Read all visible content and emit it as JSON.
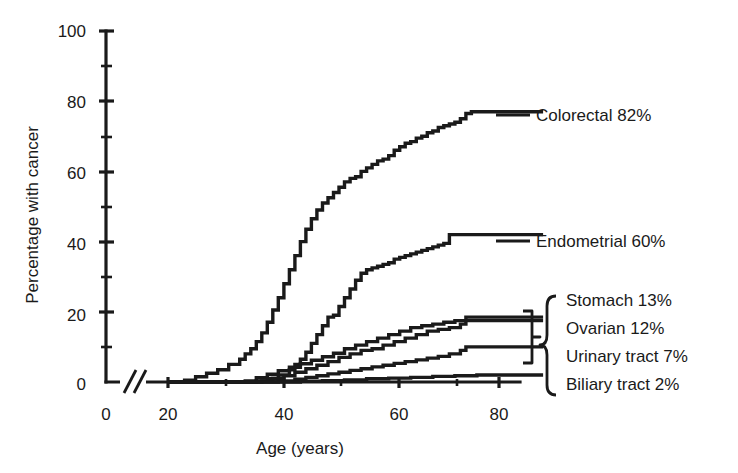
{
  "chart_data": {
    "type": "line",
    "title": "",
    "xlabel": "Age (years)",
    "ylabel": "Percentage with cancer",
    "xlim": [
      0,
      88
    ],
    "ylim": [
      0,
      100
    ],
    "grid": false,
    "axis_break": {
      "present": true,
      "between": [
        2,
        17
      ],
      "axis": "x"
    },
    "legend_position": "right-inline",
    "xticks": [
      0,
      20,
      40,
      60,
      80
    ],
    "xtick_labels": [
      "0",
      "20",
      "40",
      "60",
      "80"
    ],
    "xticks_minor": [
      30,
      50,
      70
    ],
    "yticks": [
      0,
      20,
      40,
      60,
      80,
      100
    ],
    "ytick_labels": [
      "0",
      "20",
      "40",
      "60",
      "80",
      "100"
    ],
    "yticks_minor": [
      10,
      30,
      50,
      70,
      90
    ],
    "series": [
      {
        "name": "Colorectal",
        "label": "Colorectal 82%",
        "final_percent": 82,
        "plateau_value": 77,
        "onset_age": 23,
        "x": [
          20,
          23,
          25,
          27,
          29,
          31,
          33,
          34,
          35,
          36,
          37,
          38,
          39,
          40,
          41,
          42,
          43,
          44,
          45,
          46,
          47,
          48,
          49,
          50,
          51,
          52,
          53,
          54,
          55,
          56,
          57,
          58,
          59,
          60,
          61,
          62,
          63,
          64,
          65,
          66,
          67,
          68,
          69,
          70,
          71,
          72,
          73,
          74,
          75,
          76,
          88
        ],
        "y": [
          0,
          0.5,
          1.5,
          2.5,
          3.5,
          5,
          6.5,
          8,
          9.5,
          11.5,
          14,
          17,
          20.5,
          24,
          28,
          32,
          36,
          40,
          43.5,
          46.5,
          49,
          51,
          52.5,
          54,
          55.5,
          57,
          58,
          58.5,
          60,
          61,
          62,
          63,
          63.5,
          64.5,
          66,
          67,
          68,
          68.5,
          69.5,
          70,
          71,
          71.5,
          72.5,
          73,
          73.5,
          74,
          75,
          76.5,
          77,
          77,
          77
        ]
      },
      {
        "name": "Endometrial",
        "label": "Endometrial 60%",
        "final_percent": 60,
        "plateau_value": 42,
        "onset_age": 38,
        "x": [
          20,
          36,
          38,
          40,
          42,
          43,
          44,
          45,
          46,
          47,
          48,
          49,
          50,
          51,
          52,
          53,
          54,
          55,
          56,
          57,
          58,
          59,
          60,
          61,
          62,
          63,
          64,
          65,
          66,
          67,
          68,
          69,
          70,
          71,
          72,
          73,
          74,
          75,
          88
        ],
        "y": [
          0,
          0.3,
          1,
          2,
          3.5,
          5,
          6.5,
          8.5,
          11,
          13.5,
          16,
          18.5,
          19,
          21.5,
          24,
          26.5,
          29,
          31,
          32,
          32.5,
          33,
          33.5,
          34,
          35,
          35.5,
          36,
          36.5,
          37,
          37.5,
          38,
          38.5,
          39,
          39.5,
          42,
          42,
          42,
          42,
          42,
          42
        ]
      },
      {
        "name": "Stomach",
        "label": "Stomach 13%",
        "final_percent": 13,
        "plateau_value": 18.5,
        "onset_age": 38,
        "x": [
          20,
          37,
          39,
          41,
          43,
          45,
          47,
          49,
          51,
          53,
          55,
          57,
          59,
          61,
          63,
          65,
          67,
          69,
          71,
          73,
          74,
          75,
          88
        ],
        "y": [
          0,
          0.3,
          1,
          1.8,
          2.8,
          3.8,
          4.8,
          5.8,
          7,
          8,
          9,
          9.5,
          10.5,
          11.5,
          12.5,
          13.5,
          14.5,
          15,
          15.5,
          16.5,
          18.5,
          18.5,
          18.5
        ]
      },
      {
        "name": "Ovarian",
        "label": "Ovarian 12%",
        "final_percent": 12,
        "plateau_value": 17.5,
        "onset_age": 36,
        "x": [
          20,
          34,
          36,
          38,
          40,
          42,
          44,
          46,
          48,
          50,
          52,
          54,
          56,
          58,
          60,
          62,
          64,
          66,
          68,
          70,
          72,
          73,
          88
        ],
        "y": [
          0,
          0.3,
          1.2,
          2.2,
          3.2,
          4.2,
          5.2,
          6.2,
          7.2,
          8.2,
          9.5,
          10.5,
          11.5,
          12.5,
          13.5,
          14.5,
          15.5,
          16,
          16.5,
          17,
          17.5,
          17.5,
          17.5
        ]
      },
      {
        "name": "Urinary tract",
        "label": "Urinary tract 7%",
        "final_percent": 7,
        "plateau_value": 10,
        "onset_age": 42,
        "x": [
          20,
          40,
          43,
          45,
          47,
          49,
          51,
          53,
          55,
          57,
          59,
          61,
          63,
          65,
          67,
          69,
          71,
          73,
          74,
          88
        ],
        "y": [
          0,
          0.3,
          0.8,
          1.3,
          1.8,
          2.3,
          2.8,
          3.3,
          3.8,
          4.3,
          4.8,
          5.3,
          5.8,
          6.3,
          6.8,
          7.3,
          8,
          9,
          10,
          10
        ]
      },
      {
        "name": "Biliary tract",
        "label": "Biliary tract 2%",
        "final_percent": 2,
        "plateau_value": 2,
        "onset_age": 45,
        "x": [
          20,
          44,
          48,
          52,
          56,
          60,
          64,
          68,
          72,
          76,
          88
        ],
        "y": [
          0,
          0.2,
          0.4,
          0.6,
          0.9,
          1.1,
          1.3,
          1.6,
          1.8,
          2,
          2
        ]
      }
    ],
    "bracket_groups": [
      {
        "name": "inner-pair",
        "members": [
          "Stomach",
          "Ovarian",
          "Urinary tract"
        ]
      },
      {
        "name": "outer-all",
        "members": [
          "Stomach",
          "Ovarian",
          "Urinary tract",
          "Biliary tract"
        ]
      }
    ]
  },
  "colors": {
    "ink": "#1a1a1a",
    "background": "#ffffff"
  }
}
